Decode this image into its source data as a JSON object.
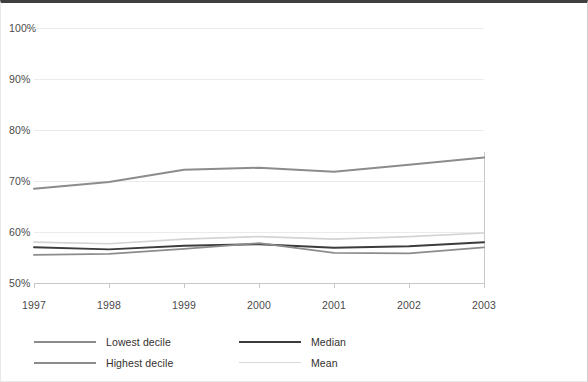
{
  "chart_data": {
    "type": "line",
    "title": "",
    "subtitle": "",
    "xlabel": "",
    "ylabel": "",
    "x": [
      1997,
      1998,
      1999,
      2000,
      2001,
      2002,
      2003
    ],
    "xtick_labels": [
      "1997",
      "1998",
      "1999",
      "2000",
      "2001",
      "2002",
      "2003"
    ],
    "ytick_labels": [
      "50%",
      "60%",
      "70%",
      "80%",
      "90%",
      "100%"
    ],
    "ytick_values": [
      50,
      60,
      70,
      80,
      90,
      100
    ],
    "ylim": [
      50,
      100
    ],
    "xlim": [
      1997,
      2003
    ],
    "grid": "horizontal",
    "legend_position": "bottom-left",
    "series": [
      {
        "name": "Highest decile",
        "color": "#8c8c8c",
        "width": 2.0,
        "values": [
          68.5,
          69.8,
          72.2,
          72.6,
          71.8,
          73.2,
          74.6
        ]
      },
      {
        "name": "Mean",
        "color": "#d4d4d4",
        "width": 1.7,
        "values": [
          58.0,
          57.7,
          58.6,
          59.1,
          58.6,
          59.1,
          59.8
        ]
      },
      {
        "name": "Median",
        "color": "#3c3c3c",
        "width": 1.9,
        "values": [
          57.0,
          56.6,
          57.3,
          57.6,
          56.9,
          57.2,
          58.0
        ]
      },
      {
        "name": "Lowest decile",
        "color": "#8c8c8c",
        "width": 1.8,
        "values": [
          55.5,
          55.7,
          56.7,
          57.8,
          55.9,
          55.8,
          57.0
        ]
      }
    ]
  },
  "legend": {
    "rows": [
      {
        "left": {
          "label": "Lowest decile",
          "color": "#8c8c8c",
          "width": 2.0
        },
        "right": {
          "label": "Median",
          "color": "#3c3c3c",
          "width": 2.4
        }
      },
      {
        "left": {
          "label": "Highest decile",
          "color": "#8c8c8c",
          "width": 2.0
        },
        "right": {
          "label": "Mean",
          "color": "#d8d8d8",
          "width": 1.8
        }
      }
    ]
  },
  "axis": {
    "line_color": "#c8c8c8",
    "grid_color": "#ebebeb",
    "tick_text_color": "#4a4a4a"
  }
}
